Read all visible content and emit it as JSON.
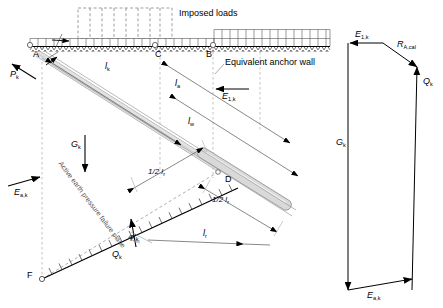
{
  "figure": {
    "line_color": "#000000",
    "grout_fill": "#d9d9d9",
    "faint_color": "#9a9a9a"
  },
  "main_diagram": {
    "points": {
      "A": "A",
      "B": "B",
      "C": "C",
      "D": "D",
      "F": "F"
    },
    "annotations": {
      "imposed_loads": "Imposed loads",
      "equivalent_anchor_wall": "Equivalent anchor wall",
      "failure_plane": "Active earth pressure failure plane"
    },
    "forces": {
      "p_k": "P",
      "p_k_sub": "k",
      "e_a_k": "E",
      "e_a_k_sub": "a,k",
      "e_1_k": "E",
      "e_1_k_sub": "1,k",
      "g_k": "G",
      "g_k_sub": "k",
      "q_k": "Q",
      "q_k_sub": "k"
    },
    "dimensions": {
      "l_k": "l",
      "l_k_sub": "k",
      "l_a": "l",
      "l_a_sub": "a",
      "l_w": "l",
      "l_w_sub": "w",
      "l_r": "l",
      "l_r_sub": "r",
      "half_l_r_upper": "1/2 l",
      "half_l_r_upper_sub": "r",
      "half_l_r_lower": "1/2 l",
      "half_l_r_lower_sub": "r"
    },
    "angles": {
      "phi_k": "φ'",
      "phi_k_sub": "k"
    }
  },
  "force_polygon": {
    "labels": {
      "e_1_k": "E",
      "e_1_k_sub": "1,k",
      "r_a_cal": "R",
      "r_a_cal_sub": "A,cal",
      "q_k": "Q",
      "q_k_sub": "k",
      "g_k": "G",
      "g_k_sub": "k",
      "e_a_k": "E",
      "e_a_k_sub": "a,k"
    }
  }
}
